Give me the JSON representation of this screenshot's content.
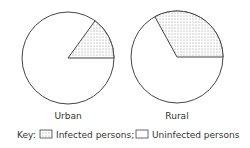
{
  "chart_data": [
    {
      "type": "pie",
      "title": "Urban",
      "categories": [
        "Infected persons",
        "Uninfected persons"
      ],
      "values": [
        15,
        85
      ],
      "start_angle_deg": 0,
      "direction": "counterclockwise"
    },
    {
      "type": "pie",
      "title": "Rural",
      "categories": [
        "Infected persons",
        "Uninfected persons"
      ],
      "values": [
        33,
        67
      ],
      "start_angle_deg": 0,
      "direction": "counterclockwise"
    }
  ],
  "charts": {
    "urban_label": "Urban",
    "rural_label": "Rural"
  },
  "legend": {
    "key_label": "Key:",
    "infected_label": "Infected persons;",
    "uninfected_label": "Uninfected persons"
  },
  "colors": {
    "stroke": "#444444",
    "dot": "#777777",
    "fill": "#ffffff"
  }
}
